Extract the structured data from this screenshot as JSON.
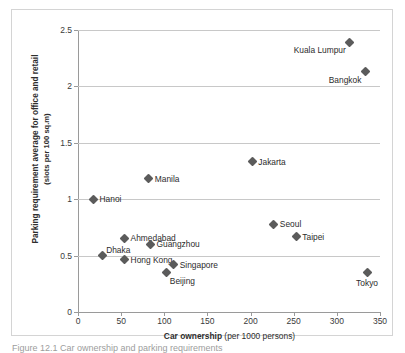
{
  "chart_data": {
    "type": "scatter",
    "title": "",
    "xlabel": "Car ownership (per 1000 persons)",
    "xlabel_bold": "Car ownership",
    "xlabel_light": "(per 1000 persons)",
    "ylabel": "Parking requirement average for office and retail",
    "ylabel_sub": "(slots per 100 sq.m)",
    "xlim": [
      0,
      350
    ],
    "ylim": [
      0,
      2.5
    ],
    "xticks": [
      0,
      50,
      100,
      150,
      200,
      250,
      300,
      350
    ],
    "xtick_labels": [
      "0",
      "50",
      "100",
      "150",
      "200",
      "250",
      "300",
      "350"
    ],
    "yticks": [
      0,
      0.5,
      1,
      1.5,
      2,
      2.5
    ],
    "ytick_labels": [
      "0",
      "0.5",
      "1",
      "1.5",
      "2",
      "2.5"
    ],
    "grid": "horizontal",
    "legend": "none",
    "marker": "diamond",
    "marker_color": "#5b5b5b",
    "points": [
      {
        "label": "Hanoi",
        "x": 18,
        "y": 1.0,
        "label_pos": "right"
      },
      {
        "label": "Dhaka",
        "x": 28,
        "y": 0.5,
        "label_pos": "above-right"
      },
      {
        "label": "Hong Kong",
        "x": 54,
        "y": 0.465,
        "label_pos": "right"
      },
      {
        "label": "Ahmedabad",
        "x": 54,
        "y": 0.655,
        "label_pos": "right"
      },
      {
        "label": "Manila",
        "x": 82,
        "y": 1.18,
        "label_pos": "right"
      },
      {
        "label": "Guangzhou",
        "x": 84,
        "y": 0.6,
        "label_pos": "right"
      },
      {
        "label": "Beijing",
        "x": 103,
        "y": 0.35,
        "label_pos": "below-right"
      },
      {
        "label": "Singapore",
        "x": 111,
        "y": 0.42,
        "label_pos": "right"
      },
      {
        "label": "Jakarta",
        "x": 202,
        "y": 1.33,
        "label_pos": "right"
      },
      {
        "label": "Seoul",
        "x": 227,
        "y": 0.78,
        "label_pos": "right"
      },
      {
        "label": "Taipei",
        "x": 253,
        "y": 0.665,
        "label_pos": "right"
      },
      {
        "label": "Kuala Lumpur",
        "x": 315,
        "y": 2.39,
        "label_pos": "below-left"
      },
      {
        "label": "Bangkok",
        "x": 333,
        "y": 2.13,
        "label_pos": "below-left"
      },
      {
        "label": "Tokyo",
        "x": 335,
        "y": 0.35,
        "label_pos": "below"
      }
    ]
  },
  "caption": {
    "text": "Figure 12.1   Car ownership and parking requirements"
  }
}
